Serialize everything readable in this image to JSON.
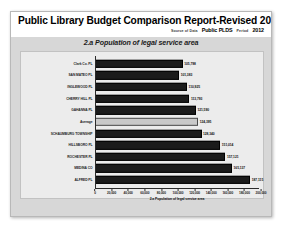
{
  "report": {
    "title": "Public Library Budget Comparison Report-Revised 2014-03-24",
    "source_label": "Source of Data",
    "source_value": "Public PLDS",
    "period_label": "Period",
    "period_value": "2012"
  },
  "chart_data": {
    "type": "bar",
    "orientation": "horizontal",
    "title": "2.a Population of legal service area",
    "xlabel": "2.a Population of legal service area",
    "ylabel": "",
    "xlim": [
      0,
      200000
    ],
    "grid": false,
    "legend": "none",
    "categories": [
      "Clark Co. PL",
      "SAN MATEO PL",
      "INGLEWOOD PL",
      "CHERRY HILL PL",
      "GAHANNA PL",
      "Average",
      "SCHAUMBURG TOWNSHIP",
      "HILLSBORO PL",
      "ROCHESTER PL",
      "MEDINA CO",
      "ALFRED PL"
    ],
    "values": [
      105798,
      101383,
      110925,
      113793,
      121590,
      124395,
      128340,
      151014,
      157121,
      165137,
      187115
    ],
    "value_labels": [
      "105,798",
      "101,383",
      "110,925",
      "113,793",
      "121,590",
      "124,395",
      "128,340",
      "151,014",
      "157,121",
      "165,137",
      "187,115"
    ],
    "highlight_category": "Average",
    "tick_values": [
      0,
      20000,
      40000,
      60000,
      80000,
      100000,
      120000,
      140000,
      160000,
      180000,
      200000
    ],
    "tick_labels": [
      "0",
      "20,000",
      "40,000",
      "60,000",
      "80,000",
      "100,000",
      "120,000",
      "140,000",
      "160,000",
      "180,000",
      "200,000"
    ],
    "colors": {
      "bar": "#1b1b1b",
      "highlight_bar": "#c9c9c9",
      "panel": "#d7d7d7",
      "plot": "#ececec"
    }
  }
}
